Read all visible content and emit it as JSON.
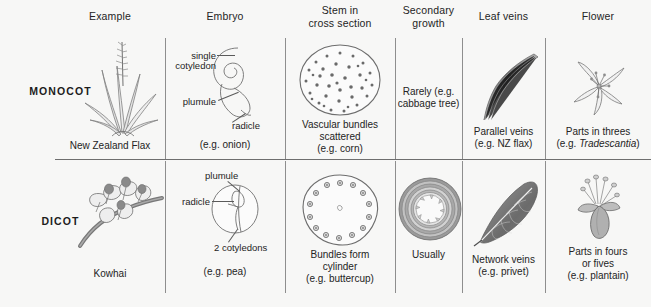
{
  "figure": {
    "background_color": "#f7f7f6",
    "rule_color": "#8e8e8e",
    "text_color": "#242424"
  },
  "columns": [
    {
      "id": "example",
      "label": "Example"
    },
    {
      "id": "embryo",
      "label": "Embryo"
    },
    {
      "id": "stem",
      "label": "Stem in\ncross section",
      "line1": "Stem in",
      "line2": "cross section"
    },
    {
      "id": "secondary_growth",
      "label": "Secondary\ngrowth",
      "line1": "Secondary",
      "line2": "growth"
    },
    {
      "id": "leaf_veins",
      "label": "Leaf veins"
    },
    {
      "id": "flower",
      "label": "Flower"
    }
  ],
  "rows": [
    {
      "id": "monocot",
      "label": "MONOCOT",
      "cells": {
        "example": {
          "caption": "New Zealand Flax",
          "art": "flax-plant-illustration"
        },
        "embryo": {
          "art": "monocot-embryo-illustration",
          "callouts": [
            "single",
            "cotyledon",
            "plumule",
            "radicle"
          ],
          "callout_single_cotyledon_line1": "single",
          "callout_single_cotyledon_line2": "cotyledon",
          "callout_plumule": "plumule",
          "callout_radicle": "radicle",
          "caption": "(e.g. onion)"
        },
        "stem": {
          "art": "monocot-stem-cross-section-illustration",
          "caption_line1": "Vascular bundles",
          "caption_line2": "scattered",
          "caption_line3": "(e.g. corn)"
        },
        "secondary_growth": {
          "caption_line1": "Rarely (e.g.",
          "caption_line2": "cabbage tree)"
        },
        "leaf_veins": {
          "art": "parallel-veins-leaf-illustration",
          "caption_line1": "Parallel veins",
          "caption_line2": "(e.g. NZ flax)"
        },
        "flower": {
          "art": "tradescantia-flower-illustration",
          "caption_line1": "Parts in threes",
          "caption_line2_prefix": "(e.g. ",
          "caption_line2_italic": "Tradescantia",
          "caption_line2_suffix": ")"
        }
      }
    },
    {
      "id": "dicot",
      "label": "DICOT",
      "cells": {
        "example": {
          "caption": "Kowhai",
          "art": "kowhai-flower-illustration"
        },
        "embryo": {
          "art": "dicot-embryo-illustration",
          "callout_plumule": "plumule",
          "callout_radicle": "radicle",
          "callout_cotyledons": "2 cotyledons",
          "caption": "(e.g. pea)"
        },
        "stem": {
          "art": "dicot-stem-cross-section-illustration",
          "caption_line1": "Bundles form",
          "caption_line2": "cylinder",
          "caption_line3": "(e.g. buttercup)"
        },
        "secondary_growth": {
          "art": "tree-trunk-rings-illustration",
          "caption_line1": "Usually"
        },
        "leaf_veins": {
          "art": "network-veins-leaf-illustration",
          "caption_line1": "Network veins",
          "caption_line2": "(e.g. privet)"
        },
        "flower": {
          "art": "plantain-flower-illustration",
          "caption_line1": "Parts in fours",
          "caption_line2": "or fives",
          "caption_line3": "(e.g. plantain)"
        }
      }
    }
  ]
}
